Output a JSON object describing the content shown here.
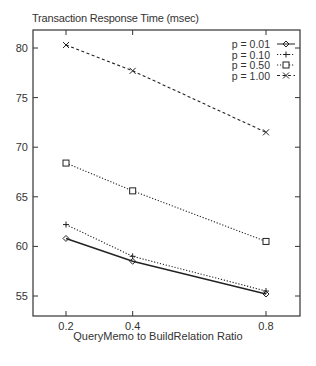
{
  "chart_data": {
    "type": "line",
    "title": "Transaction Response Time (msec)",
    "xlabel": "QueryMemo to BuildRelation Ratio",
    "ylabel": "",
    "x": [
      0.2,
      0.4,
      0.8
    ],
    "x_tick_labels": [
      "0.2",
      "0.4",
      "0.8"
    ],
    "y_ticks": [
      55,
      60,
      65,
      70,
      75,
      80
    ],
    "ylim": [
      53,
      82
    ],
    "grid": false,
    "legend_position": "upper right",
    "series": [
      {
        "name": "p = 0.01",
        "values": [
          60.8,
          58.5,
          55.2
        ],
        "marker": "diamond",
        "line": "solid"
      },
      {
        "name": "p = 0.10",
        "values": [
          62.2,
          59.0,
          55.5
        ],
        "marker": "plus",
        "line": "dotted"
      },
      {
        "name": "p = 0.50",
        "values": [
          68.4,
          65.6,
          60.5
        ],
        "marker": "square",
        "line": "dotted"
      },
      {
        "name": "p = 1.00",
        "values": [
          80.3,
          77.7,
          71.5
        ],
        "marker": "cross",
        "line": "dashed"
      }
    ]
  }
}
